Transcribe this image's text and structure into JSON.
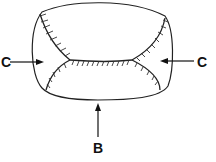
{
  "figure": {
    "labels": {
      "left": "C",
      "right": "C",
      "bottom": "B"
    },
    "colors": {
      "line": "#222222",
      "background": "#ffffff"
    }
  }
}
